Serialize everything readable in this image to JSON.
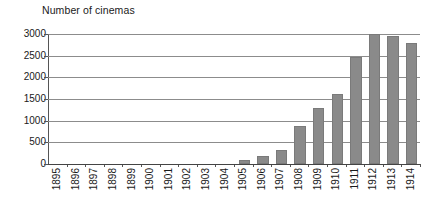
{
  "chart_data": {
    "type": "bar",
    "title": "Number of cinemas",
    "xlabel": "",
    "ylabel": "",
    "grid": true,
    "legend": false,
    "ylim": [
      0,
      3000
    ],
    "yticks": [
      0,
      500,
      1000,
      1500,
      2000,
      2500,
      3000
    ],
    "ytick_labels": [
      "0",
      "500",
      "1000",
      "1500",
      "2000",
      "2500",
      "3000"
    ],
    "categories": [
      "1895",
      "1896",
      "1897",
      "1898",
      "1899",
      "1900",
      "1901",
      "1902",
      "1903",
      "1904",
      "1905",
      "1906",
      "1907",
      "1908",
      "1909",
      "1910",
      "1911",
      "1912",
      "1913",
      "1914"
    ],
    "values": [
      0,
      0,
      0,
      0,
      0,
      0,
      0,
      0,
      0,
      0,
      100,
      190,
      330,
      870,
      1300,
      1620,
      2470,
      2990,
      2960,
      2800
    ],
    "bar_color": "#8a8a8a",
    "grid_color": "#8c8c8c",
    "axis_color": "#444444",
    "background": "#ffffff"
  }
}
